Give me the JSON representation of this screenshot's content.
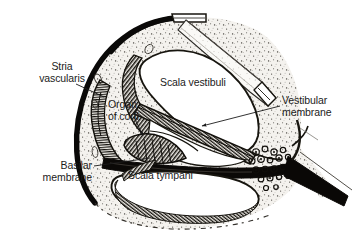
{
  "figure": {
    "background_color": "#ffffff",
    "ink_color": "#1b1b1b",
    "width": 358,
    "height": 238
  },
  "labels": [
    {
      "id": "stria-vascularis",
      "line1": "Stria",
      "line2": "vascularis",
      "align": "center"
    },
    {
      "id": "organ-of-corti",
      "line1": "Organ",
      "line2": "of corti",
      "align": "left"
    },
    {
      "id": "scala-vestibuli",
      "line1": "Scala vestibuli",
      "line2": "",
      "align": "left"
    },
    {
      "id": "vestibular-membrane",
      "line1": "Vestibular",
      "line2": "membrane",
      "align": "left"
    },
    {
      "id": "basilar-membrane",
      "line1": "Basilar",
      "line2": "membrane",
      "align": "right"
    },
    {
      "id": "scala-tympani",
      "line1": "Scala tympani",
      "line2": "",
      "align": "left"
    }
  ],
  "structures": [
    {
      "id": "bony-wall",
      "name": "Bony outer wall"
    },
    {
      "id": "scala-vestibuli",
      "name": "Scala vestibuli"
    },
    {
      "id": "scala-media",
      "name": "Scala media (cochlear duct)"
    },
    {
      "id": "scala-tympani",
      "name": "Scala tympani"
    },
    {
      "id": "vestibular-membrane",
      "name": "Vestibular (Reissner's) membrane"
    },
    {
      "id": "basilar-membrane",
      "name": "Basilar membrane"
    },
    {
      "id": "organ-of-corti",
      "name": "Organ of Corti"
    },
    {
      "id": "stria-vascularis",
      "name": "Stria vascularis"
    },
    {
      "id": "spiral-ganglion",
      "name": "Spiral ganglion"
    },
    {
      "id": "osseous-spiral-lamina",
      "name": "Osseous spiral lamina"
    }
  ]
}
